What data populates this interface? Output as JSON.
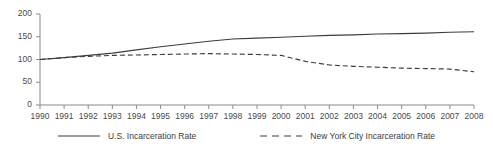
{
  "chart_data": {
    "type": "line",
    "title": "",
    "subtitle": "",
    "xlabel": "",
    "ylabel": "",
    "x": [
      1990,
      1991,
      1992,
      1993,
      1994,
      1995,
      1996,
      1997,
      1998,
      1999,
      2000,
      2001,
      2002,
      2003,
      2004,
      2005,
      2006,
      2007,
      2008
    ],
    "xtick_labels": [
      "1990",
      "1991",
      "1992",
      "1993",
      "1994",
      "1995",
      "1996",
      "1997",
      "1998",
      "1999",
      "2000",
      "2001",
      "2002",
      "2003",
      "2004",
      "2005",
      "2006",
      "2007",
      "2008"
    ],
    "ytick_labels": [
      "0",
      "50",
      "100",
      "150",
      "200"
    ],
    "yticks": [
      0,
      50,
      100,
      150,
      200
    ],
    "xlim": [
      1990,
      2008
    ],
    "ylim": [
      0,
      200
    ],
    "grid": false,
    "legend_position": "bottom",
    "series": [
      {
        "name": "U.S. Incarceration Rate",
        "style": "solid",
        "color": "#3d3d3d",
        "values": [
          100,
          104,
          109,
          114,
          121,
          128,
          134,
          140,
          145,
          147,
          149,
          151,
          153,
          154,
          156,
          157,
          158,
          160,
          161
        ]
      },
      {
        "name": "New York City Incarceration Rate",
        "style": "dashed",
        "color": "#3d3d3d",
        "values": [
          100,
          104,
          107,
          109,
          110,
          111,
          112,
          113,
          112,
          111,
          109,
          96,
          88,
          85,
          83,
          81,
          80,
          79,
          73
        ]
      }
    ]
  },
  "legend": {
    "items": [
      {
        "label": "U.S. Incarceration Rate",
        "style": "solid"
      },
      {
        "label": "New York City Incarceration Rate",
        "style": "dashed"
      }
    ]
  },
  "axes": {
    "y_axis_name": "y-axis",
    "x_axis_name": "x-axis"
  }
}
